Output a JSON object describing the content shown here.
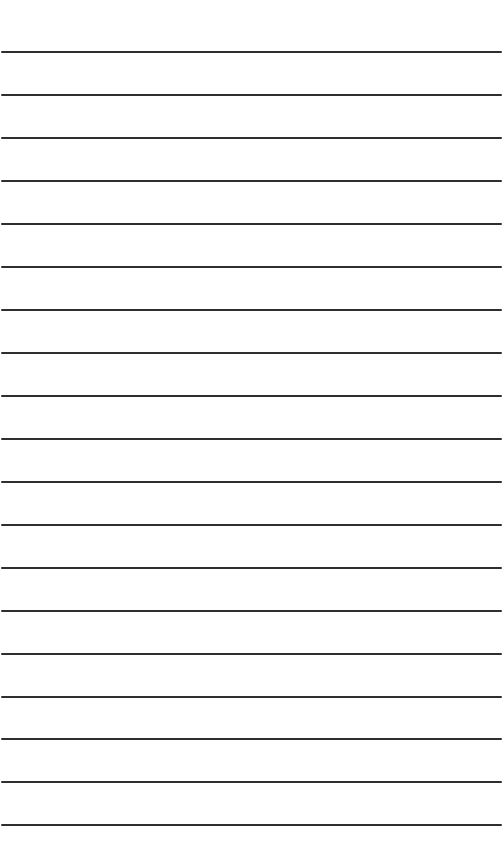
{
  "page": {
    "type": "blank-lined-paper",
    "background_color": "#ffffff",
    "rule_color": "#2e2e2e",
    "rule_count": 19,
    "rule_spacing_px": 43,
    "rules_y": [
      51,
      94,
      137,
      180,
      223,
      266,
      309,
      352,
      395,
      438,
      481,
      524,
      567,
      610,
      653,
      696,
      738,
      781,
      824
    ]
  }
}
